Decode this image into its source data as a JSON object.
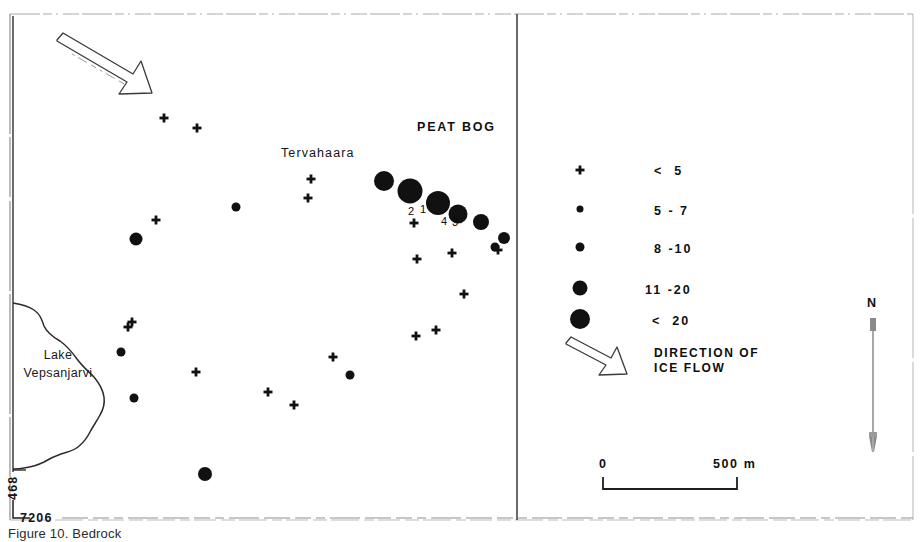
{
  "figure": {
    "width": 923,
    "height": 542,
    "background": "#ffffff",
    "ink_color": "#111111"
  },
  "map": {
    "place_labels": [
      {
        "name": "tervahaara",
        "text": "Tervahaara",
        "x": 281,
        "y": 146
      },
      {
        "name": "peat-bog",
        "text": "PEAT BOG",
        "x": 417,
        "y": 120
      },
      {
        "name": "lake",
        "line1": "Lake",
        "line2": "Vepsanjarvi",
        "x": 12,
        "y": 355
      }
    ],
    "site_numbers": [
      {
        "text": "2",
        "x": 408,
        "y": 205
      },
      {
        "text": "1",
        "x": 420,
        "y": 203
      },
      {
        "text": "4",
        "x": 441,
        "y": 215
      },
      {
        "text": "3",
        "x": 452,
        "y": 216
      }
    ],
    "coordinates": {
      "northing_label": "468",
      "easting_label": "7206"
    },
    "ice_flow_arrow": {
      "name": "ice-flow-arrow-map",
      "from_x": 58,
      "from_y": 42,
      "to_x": 145,
      "to_y": 93
    }
  },
  "chart_data": {
    "type": "scatter",
    "title": "PEAT BOG",
    "xlabel": "",
    "ylabel": "",
    "legend_position": "right panel",
    "size_classes": [
      {
        "symbol": "cross",
        "label": "<  5",
        "radius_px": 0
      },
      {
        "symbol": "circle",
        "label": "5 - 7",
        "radius_px": 3.5
      },
      {
        "symbol": "circle",
        "label": "8 -10",
        "radius_px": 4.5
      },
      {
        "symbol": "circle",
        "label": "11 -20",
        "radius_px": 7.5
      },
      {
        "symbol": "circle",
        "label": "<  20",
        "radius_px": 10
      }
    ],
    "points": [
      {
        "x": 164,
        "y": 118,
        "class": "<  5",
        "symbol": "cross",
        "r": 0
      },
      {
        "x": 197,
        "y": 128,
        "class": "<  5",
        "symbol": "cross",
        "r": 0
      },
      {
        "x": 311,
        "y": 179,
        "class": "<  5",
        "symbol": "cross",
        "r": 0
      },
      {
        "x": 308,
        "y": 198,
        "class": "<  5",
        "symbol": "cross",
        "r": 0
      },
      {
        "x": 156,
        "y": 220,
        "class": "<  5",
        "symbol": "cross",
        "r": 0
      },
      {
        "x": 414,
        "y": 223,
        "class": "<  5",
        "symbol": "cross",
        "r": 0
      },
      {
        "x": 417,
        "y": 259,
        "class": "<  5",
        "symbol": "cross",
        "r": 0
      },
      {
        "x": 452,
        "y": 253,
        "class": "<  5",
        "symbol": "cross",
        "r": 0
      },
      {
        "x": 498,
        "y": 250,
        "class": "<  5",
        "symbol": "cross",
        "r": 0
      },
      {
        "x": 464,
        "y": 294,
        "class": "<  5",
        "symbol": "cross",
        "r": 0
      },
      {
        "x": 416,
        "y": 336,
        "class": "<  5",
        "symbol": "cross",
        "r": 0
      },
      {
        "x": 436,
        "y": 330,
        "class": "<  5",
        "symbol": "cross",
        "r": 0
      },
      {
        "x": 128,
        "y": 327,
        "class": "<  5",
        "symbol": "cross",
        "r": 0
      },
      {
        "x": 333,
        "y": 357,
        "class": "<  5",
        "symbol": "cross",
        "r": 0
      },
      {
        "x": 268,
        "y": 392,
        "class": "<  5",
        "symbol": "cross",
        "r": 0
      },
      {
        "x": 294,
        "y": 405,
        "class": "<  5",
        "symbol": "cross",
        "r": 0
      },
      {
        "x": 132,
        "y": 322,
        "class": "<  5",
        "symbol": "cross",
        "r": 0
      },
      {
        "x": 196,
        "y": 372,
        "class": "<  5",
        "symbol": "cross",
        "r": 0
      },
      {
        "x": 236,
        "y": 207,
        "class": "5 - 7",
        "symbol": "circle",
        "r": 4.5
      },
      {
        "x": 350,
        "y": 375,
        "class": "5 - 7",
        "symbol": "circle",
        "r": 4.5
      },
      {
        "x": 121,
        "y": 352,
        "class": "5 - 7",
        "symbol": "circle",
        "r": 4.5
      },
      {
        "x": 134,
        "y": 398,
        "class": "5 - 7",
        "symbol": "circle",
        "r": 4.5
      },
      {
        "x": 495,
        "y": 247,
        "class": "5 - 7",
        "symbol": "circle",
        "r": 4.5
      },
      {
        "x": 136,
        "y": 239,
        "class": "8 -10",
        "symbol": "circle",
        "r": 6.5
      },
      {
        "x": 205,
        "y": 474,
        "class": "8 -10",
        "symbol": "circle",
        "r": 7
      },
      {
        "x": 504,
        "y": 238,
        "class": "8 -10",
        "symbol": "circle",
        "r": 6
      },
      {
        "x": 481,
        "y": 222,
        "class": "11 -20",
        "symbol": "circle",
        "r": 8
      },
      {
        "x": 458,
        "y": 214,
        "class": "11 -20",
        "symbol": "circle",
        "r": 9.5
      },
      {
        "x": 384,
        "y": 181,
        "class": "11 -20",
        "symbol": "circle",
        "r": 10
      },
      {
        "x": 410,
        "y": 191,
        "class": "<  20",
        "symbol": "circle",
        "r": 12.5
      },
      {
        "x": 438,
        "y": 203,
        "class": "<  20",
        "symbol": "circle",
        "r": 12
      }
    ]
  },
  "legend": {
    "name": "legend-panel",
    "entries": [
      {
        "symbol": "cross",
        "label": "<  5"
      },
      {
        "symbol": "circle",
        "label": "5 - 7"
      },
      {
        "symbol": "circle",
        "label": "8 -10"
      },
      {
        "symbol": "circle",
        "label": "11 -20"
      },
      {
        "symbol": "circle",
        "label": "<  20"
      }
    ],
    "direction": {
      "line1": "DIRECTION OF",
      "line2": "ICE FLOW"
    }
  },
  "scale_bar": {
    "name": "scale-bar",
    "start_label": "0",
    "end_label": "500 m"
  },
  "north_arrow": {
    "name": "north-arrow",
    "label": "N"
  },
  "caption": {
    "text": "Figure 10. Bedrock"
  }
}
